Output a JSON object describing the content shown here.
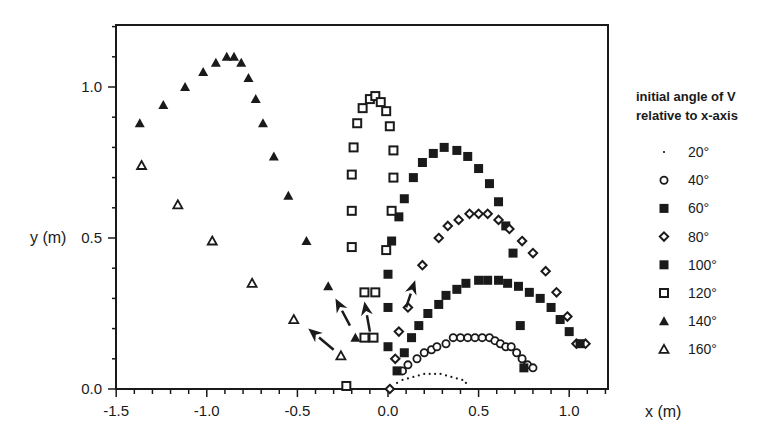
{
  "chart_data": {
    "type": "scatter",
    "title": "",
    "xlabel": "x (m)",
    "ylabel": "y (m)",
    "xlim": [
      -1.5,
      1.2
    ],
    "ylim": [
      0.0,
      1.2
    ],
    "xticks": [
      -1.5,
      -1.0,
      -0.5,
      0.0,
      0.5,
      1.0
    ],
    "xtick_labels": [
      "-1.5",
      "-1.0",
      "-0.5",
      "0.0",
      "0.5",
      "1.0"
    ],
    "yticks": [
      0.0,
      0.5,
      1.0
    ],
    "ytick_labels": [
      "0.0",
      "0.5",
      "1.0"
    ],
    "grid": false,
    "legend": {
      "position": "right",
      "title_lines": [
        "initial angle of V",
        "relative to x-axis"
      ]
    },
    "series": [
      {
        "name": "20°",
        "marker": "dot",
        "x": [
          0.05,
          0.08,
          0.11,
          0.14,
          0.17,
          0.2,
          0.23,
          0.26,
          0.29,
          0.32,
          0.35,
          0.38,
          0.41,
          0.43
        ],
        "y": [
          0.02,
          0.03,
          0.035,
          0.04,
          0.045,
          0.05,
          0.05,
          0.05,
          0.05,
          0.045,
          0.04,
          0.035,
          0.03,
          0.02
        ]
      },
      {
        "name": "40°",
        "marker": "circle-open",
        "x": [
          0.08,
          0.11,
          0.16,
          0.2,
          0.24,
          0.27,
          0.32,
          0.36,
          0.4,
          0.44,
          0.48,
          0.52,
          0.56,
          0.59,
          0.62,
          0.65,
          0.68,
          0.71,
          0.74,
          0.77,
          0.8
        ],
        "y": [
          0.06,
          0.08,
          0.1,
          0.12,
          0.13,
          0.14,
          0.15,
          0.17,
          0.17,
          0.17,
          0.17,
          0.17,
          0.17,
          0.16,
          0.15,
          0.14,
          0.14,
          0.12,
          0.1,
          0.08,
          0.07
        ]
      },
      {
        "name": "60°",
        "marker": "square-filled",
        "x": [
          0.0,
          0.0,
          0.0,
          0.02,
          0.06,
          0.09,
          0.14,
          0.19,
          0.25,
          0.31,
          0.38,
          0.44,
          0.5,
          0.56,
          0.61,
          0.65,
          0.69,
          0.73,
          0.75
        ],
        "y": [
          0.14,
          0.27,
          0.38,
          0.49,
          0.57,
          0.63,
          0.7,
          0.75,
          0.78,
          0.8,
          0.79,
          0.77,
          0.73,
          0.68,
          0.62,
          0.54,
          0.45,
          0.21,
          0.07
        ]
      },
      {
        "name": "80°",
        "marker": "diamond-open",
        "x": [
          0.01,
          0.04,
          0.06,
          0.11,
          0.19,
          0.28,
          0.33,
          0.39,
          0.45,
          0.5,
          0.55,
          0.61,
          0.67,
          0.74,
          0.8,
          0.87,
          0.93,
          0.99,
          1.04,
          1.09
        ],
        "y": [
          0.0,
          0.1,
          0.19,
          0.27,
          0.41,
          0.5,
          0.54,
          0.56,
          0.58,
          0.58,
          0.58,
          0.56,
          0.53,
          0.49,
          0.45,
          0.39,
          0.32,
          0.24,
          0.15,
          0.15
        ]
      },
      {
        "name": "100°",
        "marker": "square-filled",
        "x": [
          0.05,
          0.09,
          0.13,
          0.17,
          0.22,
          0.28,
          0.32,
          0.38,
          0.43,
          0.5,
          0.55,
          0.61,
          0.66,
          0.72,
          0.78,
          0.84,
          0.9,
          0.95,
          1.0,
          1.06
        ],
        "y": [
          0.06,
          0.12,
          0.17,
          0.21,
          0.25,
          0.28,
          0.31,
          0.33,
          0.35,
          0.36,
          0.36,
          0.36,
          0.35,
          0.34,
          0.32,
          0.3,
          0.27,
          0.23,
          0.19,
          0.15
        ]
      },
      {
        "name": "120°",
        "marker": "square-open",
        "x": [
          -0.23,
          -0.13,
          -0.08,
          -0.13,
          -0.07,
          -0.2,
          -0.2,
          -0.2,
          -0.19,
          -0.17,
          -0.14,
          -0.1,
          -0.07,
          -0.04,
          -0.01,
          0.01,
          0.03,
          0.03,
          0.02,
          -0.01
        ],
        "y": [
          0.01,
          0.17,
          0.17,
          0.32,
          0.32,
          0.47,
          0.59,
          0.71,
          0.8,
          0.88,
          0.93,
          0.96,
          0.97,
          0.95,
          0.92,
          0.87,
          0.79,
          0.7,
          0.59,
          0.46
        ]
      },
      {
        "name": "140°",
        "marker": "triangle-filled",
        "x": [
          -1.37,
          -1.24,
          -1.12,
          -1.02,
          -0.95,
          -0.89,
          -0.85,
          -0.81,
          -0.77,
          -0.73,
          -0.69,
          -0.63,
          -0.55,
          -0.45,
          -0.33,
          -0.18
        ],
        "y": [
          0.88,
          0.94,
          1.0,
          1.05,
          1.08,
          1.1,
          1.1,
          1.08,
          1.03,
          0.96,
          0.88,
          0.77,
          0.64,
          0.49,
          0.34,
          0.17
        ]
      },
      {
        "name": "160°",
        "marker": "triangle-open",
        "x": [
          -1.36,
          -1.16,
          -0.97,
          -0.75,
          -0.52,
          -0.26
        ],
        "y": [
          0.74,
          0.61,
          0.49,
          0.35,
          0.23,
          0.11
        ]
      }
    ],
    "annotations": [
      {
        "type": "arrow",
        "from": [
          -0.3,
          0.13
        ],
        "to": [
          -0.44,
          0.2
        ]
      },
      {
        "type": "arrow",
        "from": [
          -0.21,
          0.21
        ],
        "to": [
          -0.29,
          0.3
        ]
      },
      {
        "type": "arrow",
        "from": [
          -0.1,
          0.19
        ],
        "to": [
          -0.13,
          0.29
        ]
      },
      {
        "type": "arrow",
        "from": [
          0.1,
          0.27
        ],
        "to": [
          0.15,
          0.36
        ]
      }
    ]
  },
  "colors": {
    "ink": "#1a1a1a",
    "background": "#ffffff"
  }
}
